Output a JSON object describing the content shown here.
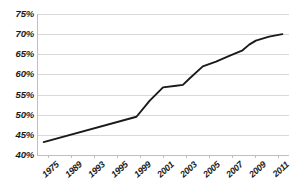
{
  "chart_data": {
    "type": "line",
    "title": "",
    "subtitle": "",
    "xlabel": "",
    "ylabel": "",
    "grid": true,
    "legend": false,
    "legend_position": "none",
    "ylim": [
      40,
      75
    ],
    "ytick_values": [
      75,
      70,
      65,
      60,
      55,
      50,
      45,
      40
    ],
    "ytick_labels": [
      "75%",
      "70%",
      "65%",
      "60%",
      "55%",
      "50%",
      "45%",
      "40%"
    ],
    "xtick_labels": [
      "1975",
      "1989",
      "1993",
      "1995",
      "1999",
      "2001",
      "2003",
      "2005",
      "2007",
      "2009",
      "2011"
    ],
    "x": [
      1975,
      1989,
      1991,
      1993,
      1995,
      1996,
      1997,
      1999,
      2001,
      2003,
      2005,
      2006,
      2007,
      2009,
      2011
    ],
    "values": [
      43.2,
      49.5,
      53.5,
      56.8,
      57.2,
      57.4,
      59.0,
      62.0,
      63.2,
      64.6,
      66.0,
      67.4,
      68.4,
      69.4,
      70.0
    ],
    "series": [
      {
        "name": "rate",
        "color": "#1a1a1a",
        "values": [
          43.2,
          49.5,
          53.5,
          56.8,
          57.2,
          57.4,
          59.0,
          62.0,
          63.2,
          64.6,
          66.0,
          67.4,
          68.4,
          69.4,
          70.0
        ]
      }
    ],
    "xlim": [
      1974,
      2012
    ]
  },
  "colors": {
    "line": "#1a1a1a",
    "grid": "#d9d9d9",
    "axis": "#bfbfbf",
    "background": "#ffffff",
    "text": "#1a1a1a"
  }
}
